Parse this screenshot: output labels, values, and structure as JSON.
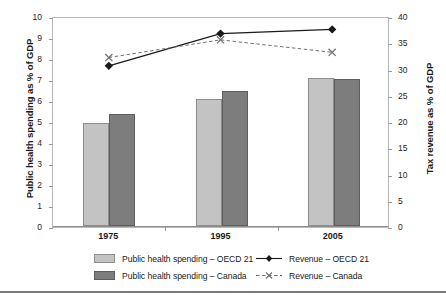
{
  "chart_data": {
    "type": "bar",
    "title": "",
    "subtitle": "",
    "categories": [
      "1975",
      "1995",
      "2005"
    ],
    "xlabel": "",
    "ylabel": "Public health spending as % of GDP",
    "ylabel_secondary": "Tax revenue as % of GDP",
    "ylim": [
      0,
      10
    ],
    "ylim_secondary": [
      0,
      40
    ],
    "yticks": [
      "0",
      "1",
      "2",
      "3",
      "4",
      "5",
      "6",
      "7",
      "8",
      "9",
      "10"
    ],
    "yticks_secondary": [
      "0",
      "5",
      "10",
      "15",
      "20",
      "25",
      "30",
      "35",
      "40"
    ],
    "grid": false,
    "legend_position": "bottom",
    "series": [
      {
        "name": "Public health spending – OECD 21",
        "kind": "bar",
        "axis": "left",
        "color": "#c3c3c3",
        "values": [
          4.9,
          6.05,
          7.05
        ]
      },
      {
        "name": "Public health spending – Canada",
        "kind": "bar",
        "axis": "left",
        "color": "#7d7d7d",
        "values": [
          5.35,
          6.45,
          6.98
        ]
      },
      {
        "name": "Revenue – OECD 21",
        "kind": "line",
        "axis": "right",
        "color": "#1a1a1a",
        "line_style": "solid",
        "marker": "diamond",
        "values": [
          30.8,
          37.0,
          37.8
        ]
      },
      {
        "name": "Revenue – Canada",
        "kind": "line",
        "axis": "right",
        "color": "#6e6e6e",
        "line_style": "dashed",
        "marker": "x",
        "values": [
          32.4,
          35.8,
          33.4
        ]
      }
    ]
  },
  "axes": {
    "left_title": "Public health spending as % of GDP",
    "right_title": "Tax revenue as % of GDP"
  },
  "legend": {
    "items": [
      {
        "label": "Public health spending – OECD 21",
        "marker": "light-gray-square-swatch"
      },
      {
        "label": "Revenue – OECD 21",
        "marker": "solid-line-diamond-marker"
      },
      {
        "label": "Public health spending – Canada",
        "marker": "dark-gray-square-swatch"
      },
      {
        "label": "Revenue – Canada",
        "marker": "dashed-line-x-marker"
      }
    ]
  }
}
